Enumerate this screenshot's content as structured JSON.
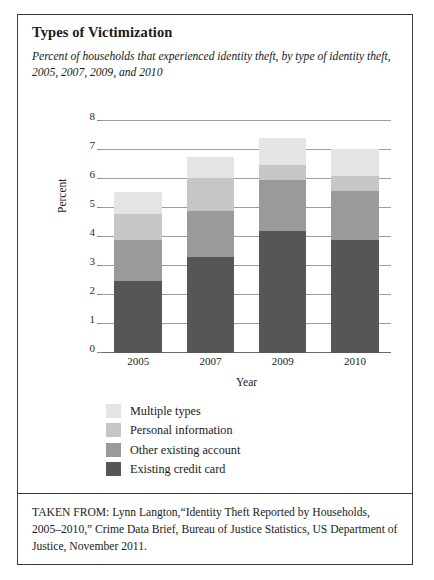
{
  "figure": {
    "title": "Types of Victimization",
    "subtitle": "Percent of households that experienced identity theft, by type of identity theft, 2005, 2007, 2009, and 2010",
    "source_note": "TAKEN FROM: Lynn Langton,“Identity Theft Reported by Households, 2005–2010,” Crime Data Brief, Bureau of Justice Statistics, US Department of Justice, November 2011."
  },
  "chart_data": {
    "type": "bar",
    "subtype": "stacked-column",
    "title": "Types of Victimization",
    "subtitle": "Percent of households that experienced identity theft, by type of identity theft, 2005, 2007, 2009, and 2010",
    "xlabel": "Year",
    "ylabel": "Percent",
    "categories": [
      "2005",
      "2007",
      "2009",
      "2010"
    ],
    "ylim": [
      0,
      8
    ],
    "yticks": [
      0,
      1,
      2,
      3,
      4,
      5,
      6,
      7,
      8
    ],
    "ytick_labels": [
      "0",
      "1",
      "2",
      "3",
      "4",
      "5",
      "6",
      "7",
      "8"
    ],
    "grid": true,
    "legend_position": "below-plot-left",
    "stack_order_bottom_to_top": [
      "Existing credit card",
      "Other existing account",
      "Personal information",
      "Multiple types"
    ],
    "series": [
      {
        "name": "Existing credit card",
        "color": "#565656",
        "values": [
          2.5,
          3.3,
          4.2,
          3.9
        ]
      },
      {
        "name": "Other existing account",
        "color": "#9a9a9a",
        "values": [
          1.4,
          1.6,
          1.75,
          1.7
        ]
      },
      {
        "name": "Personal information",
        "color": "#c6c6c6",
        "values": [
          0.9,
          1.15,
          0.55,
          0.5
        ]
      },
      {
        "name": "Multiple types",
        "color": "#e4e4e4",
        "values": [
          0.75,
          0.7,
          0.9,
          0.95
        ]
      }
    ],
    "cumulative_tops": {
      "2005": [
        2.5,
        3.9,
        4.8,
        5.55
      ],
      "2007": [
        3.3,
        4.9,
        6.05,
        6.75
      ],
      "2009": [
        4.2,
        5.95,
        6.5,
        7.4
      ],
      "2010": [
        3.9,
        5.6,
        6.1,
        7.05
      ]
    },
    "totals": [
      5.55,
      6.75,
      7.4,
      7.05
    ]
  },
  "legend": {
    "items": [
      {
        "label": "Multiple types",
        "color": "#e4e4e4"
      },
      {
        "label": "Personal information",
        "color": "#c6c6c6"
      },
      {
        "label": "Other existing account",
        "color": "#9a9a9a"
      },
      {
        "label": "Existing credit card",
        "color": "#565656"
      }
    ]
  }
}
